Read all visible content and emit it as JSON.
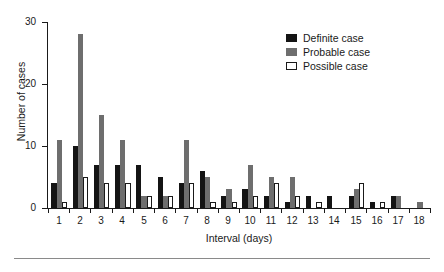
{
  "chart_data": {
    "type": "bar",
    "title": "",
    "xlabel": "Interval (days)",
    "ylabel": "Number of cases",
    "categories": [
      "1",
      "2",
      "3",
      "4",
      "5",
      "6",
      "7",
      "8",
      "9",
      "10",
      "11",
      "12",
      "13",
      "14",
      "15",
      "16",
      "17",
      "18"
    ],
    "series": [
      {
        "name": "Definite case",
        "color": "#141414",
        "values": [
          4,
          10,
          7,
          7,
          7,
          5,
          4,
          6,
          2,
          3,
          2,
          1,
          2,
          2,
          2,
          1,
          2,
          0
        ]
      },
      {
        "name": "Probable case",
        "color": "#6e6e6e",
        "values": [
          11,
          28,
          15,
          11,
          2,
          2,
          11,
          5,
          3,
          7,
          5,
          5,
          0,
          0,
          3,
          0,
          2,
          1
        ]
      },
      {
        "name": "Possible case",
        "color": "#ffffff",
        "values": [
          1,
          5,
          4,
          4,
          2,
          2,
          4,
          1,
          1,
          2,
          4,
          2,
          1,
          0,
          4,
          1,
          0,
          0
        ]
      }
    ],
    "ylim": [
      0,
      30
    ],
    "yticks": [
      0,
      10,
      20,
      30
    ],
    "ytick_labels": [
      "0",
      "10",
      "20",
      "30"
    ],
    "grid": false,
    "legend_position": "top-right",
    "legend_entries": [
      "Definite case",
      "Probable case",
      "Possible case"
    ]
  },
  "legend": {
    "items": [
      {
        "label": "Definite case",
        "swatch": "definite"
      },
      {
        "label": "Probable case",
        "swatch": "probable"
      },
      {
        "label": "Possible case",
        "swatch": "possible"
      }
    ]
  },
  "axes": {
    "y_title": "Number of cases",
    "x_title": "Interval (days)"
  }
}
